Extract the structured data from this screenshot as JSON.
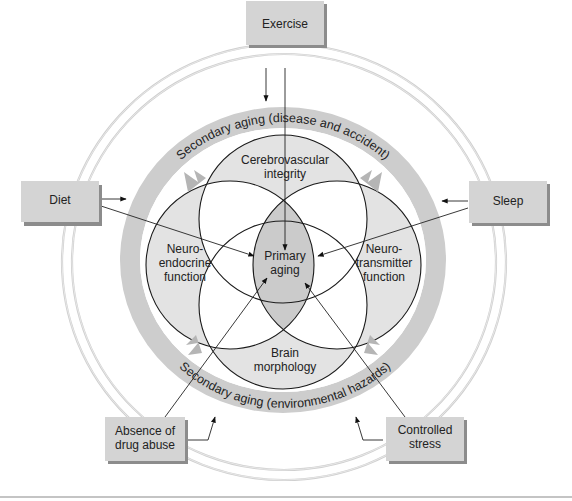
{
  "diagram": {
    "factors": {
      "exercise": "Exercise",
      "diet": "Diet",
      "sleep": "Sleep",
      "drug_abuse": [
        "Absence of",
        "drug abuse"
      ],
      "stress": [
        "Controlled",
        "stress"
      ]
    },
    "band_labels": {
      "top": "Secondary aging (disease and accident)",
      "bottom": "Secondary aging (environmental hazards)"
    },
    "domains": {
      "cerebrovascular": [
        "Cerebrovascular",
        "integrity"
      ],
      "neuroendocrine": [
        "Neuro-",
        "endocrine",
        "function"
      ],
      "neurotransmitter": [
        "Neuro-",
        "transmitter",
        "function"
      ],
      "brain": [
        "Brain",
        "morphology"
      ],
      "primary": [
        "Primary",
        "aging"
      ]
    },
    "colors": {
      "box_fill": "#d4d4d4",
      "band_fill": "#cdcdcd",
      "circle_fill": "#e3e3e3",
      "primary_fill": "#cbcbcb",
      "ring": "#cfcfcf"
    }
  }
}
